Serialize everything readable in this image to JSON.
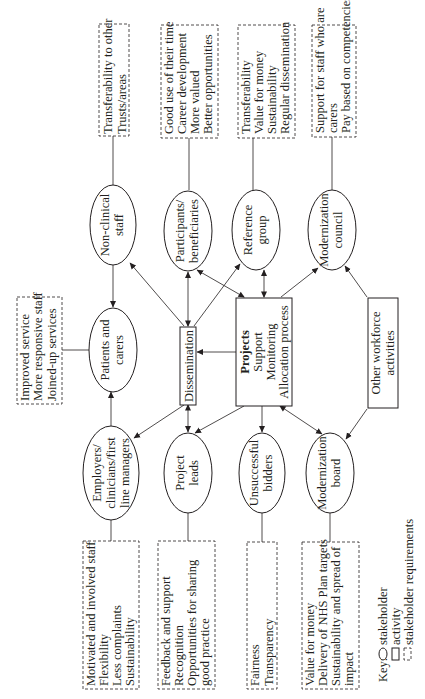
{
  "diagram": {
    "orientation": "rotated-90-ccw",
    "stakeholders": {
      "non_clinical_staff": {
        "line1": "Non-clinical",
        "line2": "staff"
      },
      "participants": {
        "line1": "Participants/",
        "line2": "beneficiaries"
      },
      "reference_group": {
        "line1": "Reference",
        "line2": "group"
      },
      "modernization_council": {
        "line1": "Modernization",
        "line2": "council"
      },
      "patients_carers": {
        "line1": "Patients and",
        "line2": "carers"
      },
      "employers": {
        "line1": "Employers/",
        "line2": "clinicians/first",
        "line3": "line managers"
      },
      "project_leads": {
        "line1": "Project",
        "line2": "leads"
      },
      "unsuccessful_bidders": {
        "line1": "Unsuccessful",
        "line2": "bidders"
      },
      "modernization_board": {
        "line1": "Modernization",
        "line2": "board"
      }
    },
    "activities": {
      "dissemination": {
        "label": "Dissemination"
      },
      "projects": {
        "title": "Projects",
        "line2": "Support",
        "line3": "Monitoring",
        "line4": "Allocation process"
      },
      "other_workforce": {
        "line1": "Other workforce",
        "line2": "activities"
      }
    },
    "requirements": {
      "non_clinical_staff": [
        "Transferability to other",
        "Trusts/areas"
      ],
      "participants": [
        "Good use of their time",
        "Career development",
        "More valued",
        "Better opportunities"
      ],
      "reference_group": [
        "Transferability",
        "Value for money",
        "Sustainability",
        "Regular dissemination"
      ],
      "modernization_council": [
        "Support for staff who are",
        "carers",
        "Pay based on competencies"
      ],
      "patients_carers": [
        "Improved service",
        "More responsive staff",
        "Joined-up services"
      ],
      "employers": [
        "Motivated and involved staff",
        "Flexibility",
        "Less complaints",
        "Sustainability"
      ],
      "project_leads": [
        "Feedback and support",
        "Recognition",
        "Opportunities for sharing",
        "good practice"
      ],
      "unsuccessful_bidders": [
        "Fairness",
        "Transparency"
      ],
      "modernization_board": [
        "Value for money",
        "Delivery of NHS Plan targets",
        "Sustainability and spread of",
        "impact"
      ]
    },
    "key": {
      "title": "Key:",
      "stakeholder": "stakeholder",
      "activity": "activity",
      "requirements": "stakeholder requirements"
    }
  }
}
